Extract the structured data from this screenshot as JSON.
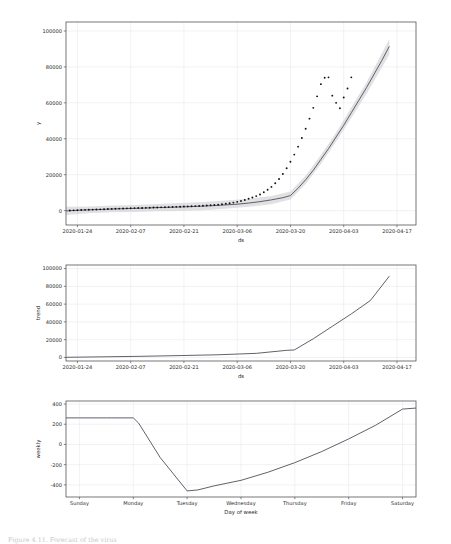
{
  "figure": {
    "caption": "Figure 4.11. Forecast of the virus"
  },
  "chart_data": [
    {
      "id": "forecast",
      "type": "line",
      "title": "",
      "xlabel": "ds",
      "ylabel": "y",
      "ylim": [
        -8000,
        105000
      ],
      "yticks": [
        0,
        20000,
        40000,
        60000,
        80000,
        100000
      ],
      "ytick_labels": [
        "0",
        "20000",
        "40000",
        "60000",
        "80000",
        "100000"
      ],
      "xtick_labels": [
        "2020-01-24",
        "2020-02-07",
        "2020-02-21",
        "2020-03-06",
        "2020-03-20",
        "2020-04-03",
        "2020-04-17"
      ],
      "xtick_positions": [
        3,
        17,
        31,
        45,
        59,
        73,
        87
      ],
      "xlim": [
        0,
        92
      ],
      "grid": true,
      "legend": "none",
      "series": [
        {
          "name": "yhat",
          "kind": "line",
          "x": [
            0,
            3,
            6,
            9,
            12,
            15,
            18,
            21,
            24,
            27,
            30,
            33,
            36,
            39,
            42,
            45,
            48,
            51,
            54,
            57,
            59,
            61,
            63,
            65,
            67,
            69,
            71,
            73,
            75,
            77,
            79,
            81,
            83,
            85
          ],
          "y": [
            -150,
            200,
            420,
            640,
            900,
            1080,
            1250,
            1450,
            1700,
            1850,
            2050,
            2250,
            2500,
            2800,
            3200,
            3600,
            4200,
            5000,
            6000,
            7200,
            8400,
            12500,
            17200,
            22500,
            28500,
            34500,
            41000,
            47500,
            54500,
            61500,
            68500,
            76000,
            83500,
            91500
          ]
        },
        {
          "name": "yhat_lower",
          "kind": "band_lower",
          "x": [
            0,
            6,
            12,
            18,
            24,
            30,
            36,
            42,
            48,
            54,
            59,
            63,
            67,
            71,
            75,
            79,
            83,
            85
          ],
          "y": [
            -2400,
            -1400,
            -900,
            -700,
            -400,
            -150,
            250,
            1100,
            2100,
            3600,
            6200,
            14800,
            26000,
            38500,
            51500,
            65000,
            79500,
            87000
          ]
        },
        {
          "name": "yhat_upper",
          "kind": "band_upper",
          "x": [
            0,
            6,
            12,
            18,
            24,
            30,
            36,
            42,
            48,
            54,
            59,
            63,
            67,
            71,
            75,
            79,
            83,
            85
          ],
          "y": [
            2200,
            2300,
            2800,
            3200,
            3700,
            4200,
            4800,
            5600,
            6600,
            8200,
            10600,
            19600,
            31000,
            43500,
            57500,
            71500,
            87500,
            95500
          ]
        },
        {
          "name": "observations",
          "kind": "scatter",
          "x": [
            1,
            2,
            3,
            4,
            5,
            6,
            7,
            8,
            9,
            10,
            11,
            12,
            13,
            14,
            15,
            16,
            17,
            18,
            19,
            20,
            21,
            22,
            23,
            24,
            25,
            26,
            27,
            28,
            29,
            30,
            31,
            32,
            33,
            34,
            35,
            36,
            37,
            38,
            39,
            40,
            41,
            42,
            43,
            44,
            45,
            46,
            47,
            48,
            49,
            50,
            51,
            52,
            53,
            54,
            55,
            56,
            57,
            58,
            59,
            60,
            61,
            62,
            63,
            64,
            65,
            66,
            67,
            68,
            69,
            70,
            71,
            72,
            73,
            74,
            75
          ],
          "y": [
            60,
            150,
            250,
            330,
            420,
            500,
            560,
            650,
            720,
            800,
            880,
            960,
            1050,
            1120,
            1200,
            1260,
            1320,
            1400,
            1450,
            1500,
            1560,
            1620,
            1700,
            1760,
            1820,
            1890,
            1960,
            2030,
            2100,
            2180,
            2260,
            2340,
            2420,
            2520,
            2620,
            2720,
            2860,
            3000,
            3160,
            3340,
            3560,
            3820,
            4120,
            4480,
            4900,
            5400,
            5950,
            6600,
            7300,
            8100,
            9000,
            10200,
            11600,
            13200,
            15200,
            17600,
            20400,
            23600,
            27200,
            31200,
            35600,
            40400,
            45600,
            51200,
            57200,
            63600,
            70400,
            74000,
            74200,
            64000,
            60000,
            57000,
            63000,
            68000,
            74200
          ]
        }
      ]
    },
    {
      "id": "trend",
      "type": "line",
      "title": "",
      "xlabel": "ds",
      "ylabel": "trend",
      "ylim": [
        -4000,
        104000
      ],
      "yticks": [
        0,
        20000,
        40000,
        60000,
        80000,
        100000
      ],
      "ytick_labels": [
        "0",
        "20000",
        "40000",
        "60000",
        "80000",
        "100000"
      ],
      "xtick_labels": [
        "2020-01-24",
        "2020-02-07",
        "2020-02-21",
        "2020-03-06",
        "2020-03-20",
        "2020-04-03",
        "2020-04-17"
      ],
      "xtick_positions": [
        3,
        17,
        31,
        45,
        59,
        73,
        87
      ],
      "xlim": [
        0,
        92
      ],
      "grid": true,
      "legend": "none",
      "series": [
        {
          "name": "trend",
          "kind": "line",
          "x": [
            0,
            10,
            20,
            30,
            40,
            50,
            58,
            60,
            65,
            70,
            75,
            80,
            85
          ],
          "y": [
            150,
            700,
            1300,
            2100,
            3000,
            4600,
            8000,
            8400,
            21000,
            35000,
            49000,
            64000,
            91500
          ]
        }
      ]
    },
    {
      "id": "weekly",
      "type": "line",
      "title": "",
      "xlabel": "Day of week",
      "ylabel": "weekly",
      "ylim": [
        -520,
        430
      ],
      "yticks": [
        -400,
        -200,
        0,
        200,
        400
      ],
      "ytick_labels": [
        "-400",
        "-200",
        "0",
        "200",
        "400"
      ],
      "xtick_labels": [
        "Sunday",
        "Monday",
        "Tuesday",
        "Wednesday",
        "Thursday",
        "Friday",
        "Saturday"
      ],
      "xtick_positions": [
        0,
        1,
        2,
        3,
        4,
        5,
        6
      ],
      "xlim": [
        -0.25,
        6.25
      ],
      "grid": true,
      "legend": "none",
      "series": [
        {
          "name": "weekly",
          "kind": "line",
          "x": [
            -0.25,
            0,
            0.5,
            1.0,
            1.1,
            1.5,
            2.0,
            2.2,
            2.5,
            3.0,
            3.5,
            4.0,
            4.5,
            5.0,
            5.5,
            6.0,
            6.25
          ],
          "y": [
            263,
            263,
            263,
            263,
            210,
            -130,
            -460,
            -450,
            -410,
            -355,
            -275,
            -180,
            -70,
            55,
            190,
            350,
            360
          ]
        }
      ]
    }
  ]
}
